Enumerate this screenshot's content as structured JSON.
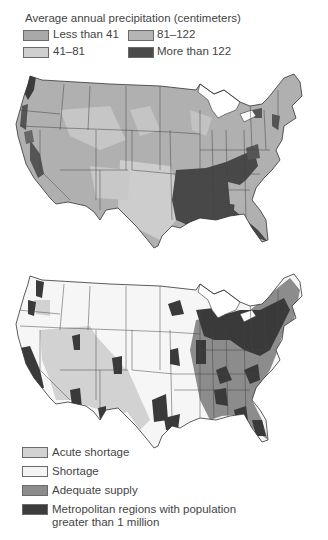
{
  "precipitation_map": {
    "legend_title": "Average annual precipitation (centimeters)",
    "legend": [
      {
        "label": "Less than 41",
        "color": "#a9a9a9"
      },
      {
        "label": "41–81",
        "color": "#cfcfcf"
      },
      {
        "label": "81–122",
        "color": "#b5b5b5"
      },
      {
        "label": "More than 122",
        "color": "#4a4a4a"
      }
    ]
  },
  "water_supply_map": {
    "legend": [
      {
        "label": "Acute shortage",
        "color": "#d2d2d2"
      },
      {
        "label": "Shortage",
        "color": "#f4f4f4"
      },
      {
        "label": "Adequate supply",
        "color": "#8c8c8c"
      },
      {
        "label": "Metropolitan regions with population",
        "label2": "greater than 1 million",
        "color": "#3c3c3c"
      }
    ]
  }
}
